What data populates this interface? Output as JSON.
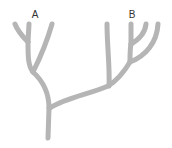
{
  "diagram": {
    "type": "phylogenetic-tree",
    "labels": [
      {
        "id": "A",
        "text": "A",
        "x": 35,
        "y": 10
      },
      {
        "id": "B",
        "text": "B",
        "x": 132,
        "y": 10
      }
    ],
    "colors": {
      "branch": "#b5b5b5",
      "label": "#333333",
      "background": "#ffffff"
    },
    "branch_width": 5
  }
}
